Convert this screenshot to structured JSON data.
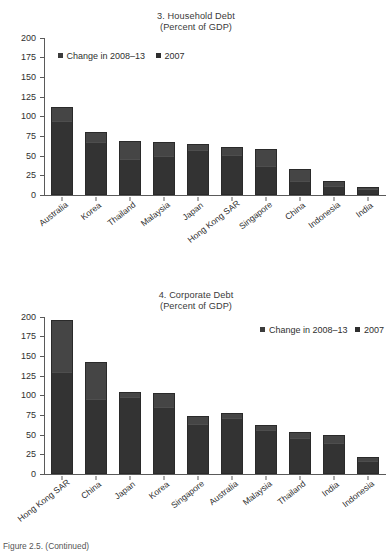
{
  "figure_note": "Figure 2.5. (Continued)",
  "legend": {
    "change_label": "Change in 2008–13",
    "year_label": "2007"
  },
  "panels": [
    {
      "id": "household-debt",
      "title": "3. Household Debt",
      "subtitle": "(Percent of GDP)"
    },
    {
      "id": "corporate-debt",
      "title": "4. Corporate Debt",
      "subtitle": "(Percent of GDP)"
    }
  ],
  "chart_data": [
    {
      "type": "bar",
      "stacked": true,
      "title": "3. Household Debt",
      "subtitle": "(Percent of GDP)",
      "xlabel": "",
      "ylabel": "",
      "ylim": [
        0,
        200
      ],
      "yticks": [
        0,
        25,
        50,
        75,
        100,
        125,
        150,
        175,
        200
      ],
      "grid": false,
      "legend_position": "top-left",
      "categories": [
        "Australia",
        "Korea",
        "Thailand",
        "Malaysia",
        "Japan",
        "Hong Kong SAR",
        "Singapore",
        "China",
        "Indonesia",
        "India"
      ],
      "series": [
        {
          "name": "2007",
          "values": [
            95,
            68,
            45,
            50,
            58,
            52,
            36,
            17,
            11,
            7
          ]
        },
        {
          "name": "Change in 2008–13",
          "values": [
            17,
            12,
            24,
            17,
            7,
            9,
            23,
            16,
            6,
            3
          ]
        }
      ],
      "totals": [
        112,
        80,
        69,
        67,
        65,
        61,
        59,
        33,
        17,
        10
      ]
    },
    {
      "type": "bar",
      "stacked": true,
      "title": "4. Corporate Debt",
      "subtitle": "(Percent of GDP)",
      "xlabel": "",
      "ylabel": "",
      "ylim": [
        0,
        200
      ],
      "yticks": [
        0,
        25,
        50,
        75,
        100,
        125,
        150,
        175,
        200
      ],
      "grid": false,
      "legend_position": "top-right",
      "categories": [
        "Hong Kong SAR",
        "China",
        "Japan",
        "Korea",
        "Singapore",
        "Australia",
        "Malaysia",
        "Thailand",
        "India",
        "Indonesia"
      ],
      "series": [
        {
          "name": "2007",
          "values": [
            130,
            95,
            99,
            86,
            64,
            72,
            57,
            47,
            40,
            17
          ]
        },
        {
          "name": "Change in 2008–13",
          "values": [
            66,
            47,
            5,
            17,
            10,
            5,
            5,
            6,
            10,
            5
          ]
        }
      ],
      "totals": [
        196,
        142,
        104,
        103,
        74,
        77,
        62,
        53,
        50,
        22
      ]
    }
  ]
}
